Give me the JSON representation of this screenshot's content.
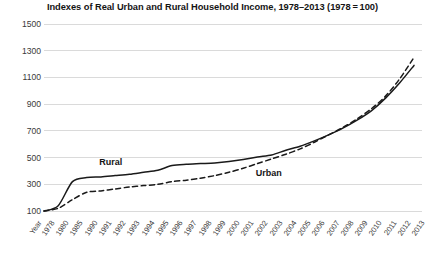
{
  "chart_data": {
    "type": "line",
    "title": "Indexes of Real Urban and Rural Household Income, 1978–2013  (1978 = 100)",
    "xlabel": "Year",
    "ylabel": "",
    "ylim": [
      100,
      1500
    ],
    "yticks": [
      100,
      300,
      500,
      700,
      900,
      1100,
      1300,
      1500
    ],
    "ytick_labels": [
      "100",
      "300",
      "500",
      "700",
      "900",
      "1100",
      "1300",
      "1500"
    ],
    "grid": true,
    "grid_axis": "y",
    "legend": "inline-labels",
    "axis_origin_label": "Year",
    "categories": [
      "1978",
      "1980",
      "1985",
      "1990",
      "1991",
      "1992",
      "1993",
      "1994",
      "1995",
      "1996",
      "1997",
      "1998",
      "1999",
      "2000",
      "2001",
      "2002",
      "2003",
      "2004",
      "2005",
      "2006",
      "2007",
      "2008",
      "2009",
      "2010",
      "2011",
      "2012",
      "2013"
    ],
    "series": [
      {
        "name": "Rural",
        "style": "solid",
        "color": "#1a1a1a",
        "label_x_category": "1992",
        "values": [
          100,
          140,
          320,
          350,
          355,
          365,
          375,
          390,
          405,
          440,
          450,
          455,
          460,
          470,
          485,
          505,
          520,
          555,
          585,
          625,
          670,
          720,
          780,
          850,
          945,
          1060,
          1190
        ]
      },
      {
        "name": "Urban",
        "style": "dashed",
        "color": "#1a1a1a",
        "label_x_category": "2003",
        "values": [
          100,
          120,
          185,
          240,
          250,
          265,
          280,
          290,
          300,
          320,
          330,
          345,
          365,
          390,
          420,
          455,
          490,
          525,
          565,
          615,
          670,
          725,
          790,
          865,
          960,
          1090,
          1250
        ]
      }
    ]
  }
}
